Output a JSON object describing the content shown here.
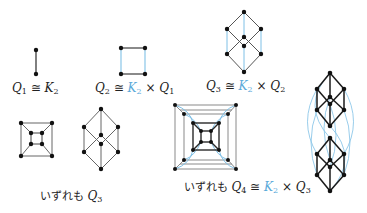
{
  "colors": {
    "edge": "#2a2a2a",
    "edge_light": "#8a8a8a",
    "product_edge": "#7fc0e6",
    "accent_text": "#5aa9d9",
    "vertex": "#111111"
  },
  "labels": {
    "q1": {
      "sym": "Q",
      "sub": "1",
      "rel": " ≅ ",
      "rhs": "K",
      "rhs_sub": "2"
    },
    "q2": {
      "sym": "Q",
      "sub": "2",
      "rel": " ≅ ",
      "k": "K",
      "k_sub": "2",
      "times": " × ",
      "rhs": "Q",
      "rhs_sub": "1"
    },
    "q3": {
      "sym": "Q",
      "sub": "3",
      "rel": " ≅ ",
      "k": "K",
      "k_sub": "2",
      "times": " × ",
      "rhs": "Q",
      "rhs_sub": "2"
    },
    "both_q3": {
      "prefix": "いずれも ",
      "sym": "Q",
      "sub": "3"
    },
    "both_q4": {
      "prefix": "いずれも ",
      "sym": "Q",
      "sub": "4",
      "rel": " ≅ ",
      "k": "K",
      "k_sub": "2",
      "times": " × ",
      "rhs": "Q",
      "rhs_sub": "3"
    }
  },
  "figures": [
    "Q1 hypercube graph (single edge)",
    "Q2 square as K2 × Q1",
    "Q3 cube as K2 × Q2",
    "Q3 nested-square drawing",
    "Q3 hexagonal drawing",
    "Q4 nested-square drawing",
    "Q4 as two stacked Q3 cubes joined by K2 edges"
  ]
}
